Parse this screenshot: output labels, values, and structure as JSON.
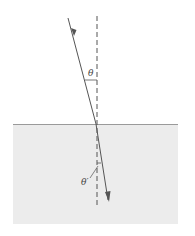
{
  "diagram": {
    "type": "refraction",
    "labels": {
      "incident_angle": "θ",
      "refracted_angle": "θ′"
    },
    "colors": {
      "ray": "#555555",
      "normal": "#555555",
      "medium_fill": "#ececec",
      "interface_line": "#9a9a9a"
    }
  }
}
